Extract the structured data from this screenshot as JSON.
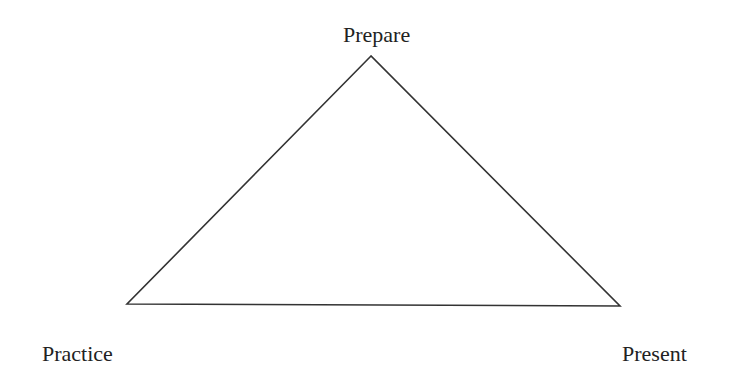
{
  "diagram": {
    "type": "triangle",
    "vertices": {
      "top": {
        "label": "Prepare",
        "x": 371,
        "y": 56
      },
      "bottom_left": {
        "label": "Practice",
        "x": 127,
        "y": 304
      },
      "bottom_right": {
        "label": "Present",
        "x": 620,
        "y": 306
      }
    },
    "stroke_color": "#333333",
    "background": "#ffffff"
  }
}
